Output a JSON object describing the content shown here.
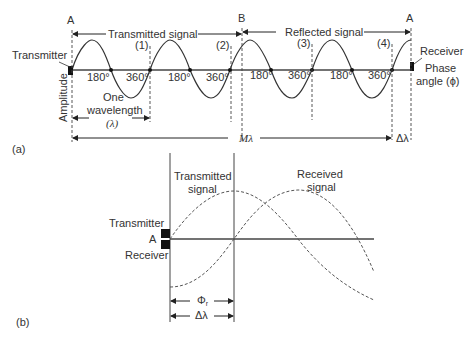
{
  "panel_a": {
    "label": "(a)",
    "point_a_left": "A",
    "point_b": "B",
    "point_a_right": "A",
    "transmitted_label": "Transmitted signal",
    "reflected_label": "Reflected signal",
    "transmitter_label": "Transmitter",
    "receiver_label": "Receiver",
    "phase_label_1": "Phase",
    "phase_label_2": "angle (ϕ)",
    "amplitude_label": "Amplitude",
    "markers": [
      "(1)",
      "(2)",
      "(3)",
      "(4)"
    ],
    "angles": [
      "180°",
      "360°",
      "180°",
      "360°",
      "180°",
      "360°",
      "180°",
      "360°"
    ],
    "wavelength_1": "One",
    "wavelength_2": "wavelength",
    "wavelength_3": "(λ)",
    "m_lambda": "Mλ",
    "delta_lambda": "Δλ"
  },
  "panel_b": {
    "label": "(b)",
    "transmitted_1": "Transmitted",
    "transmitted_2": "signal",
    "received_1": "Received",
    "received_2": "signal",
    "transmitter_label": "Transmitter",
    "point_a": "A",
    "receiver_label": "Receiver",
    "phi_r": "Φ",
    "phi_sub": "r",
    "delta_lambda": "Δλ"
  }
}
